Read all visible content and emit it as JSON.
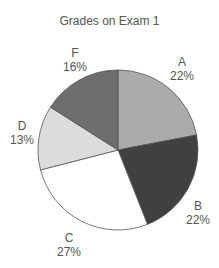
{
  "chart_data": {
    "type": "pie",
    "title": "Grades on Exam 1",
    "categories": [
      "A",
      "B",
      "C",
      "D",
      "F"
    ],
    "values": [
      22,
      22,
      27,
      13,
      16
    ],
    "labels": [
      "22%",
      "22%",
      "27%",
      "13%",
      "16%"
    ],
    "colors": [
      "#ababab",
      "#404040",
      "#ffffff",
      "#dcdcdc",
      "#6e6e6e"
    ],
    "legend": "none",
    "start_angle": "12 o'clock, clockwise"
  }
}
